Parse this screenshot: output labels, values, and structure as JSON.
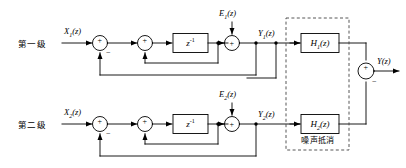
{
  "figure": {
    "type": "block-diagram",
    "stages": [
      {
        "id": "stage1",
        "label": "第一级",
        "input": "X₁(z)",
        "error_injection": "E₁(z)",
        "output": "Y₁(z)",
        "delay_block": "z⁻¹",
        "filter_block": "H₁(z)"
      },
      {
        "id": "stage2",
        "label": "第二级",
        "input": "X₂(z)",
        "error_injection": "E₂(z)",
        "output": "Y₂(z)",
        "delay_block": "z⁻¹",
        "filter_block": "H₂(z)"
      }
    ],
    "dashed_region": {
      "caption": "噪声抵消"
    },
    "final_output": "Y(z)",
    "signs": {
      "plus": "+",
      "minus": "−"
    },
    "colors": {
      "line": "#000000",
      "background": "#ffffff",
      "dashed": "#555555"
    }
  },
  "labels": {
    "stage1_name": "第一级",
    "stage2_name": "第二级",
    "x1": "X",
    "x1_sub": "1",
    "x1_arg": "(z)",
    "x2": "X",
    "x2_sub": "2",
    "x2_arg": "(z)",
    "e1": "E",
    "e1_sub": "1",
    "e1_arg": "(z)",
    "e2": "E",
    "e2_sub": "2",
    "e2_arg": "(z)",
    "y1": "Y",
    "y1_sub": "1",
    "y1_arg": "(z)",
    "y2": "Y",
    "y2_sub": "2",
    "y2_arg": "(z)",
    "y_out": "Y",
    "y_out_arg": "(z)",
    "delay1": "z",
    "delay1_sup": "-1",
    "delay2": "z",
    "delay2_sup": "-1",
    "h1": "H",
    "h1_sub": "1",
    "h1_arg": "(z)",
    "h2": "H",
    "h2_sub": "2",
    "h2_arg": "(z)",
    "noise_cancel": "噪声抵消",
    "plus": "+",
    "minus": "−"
  }
}
